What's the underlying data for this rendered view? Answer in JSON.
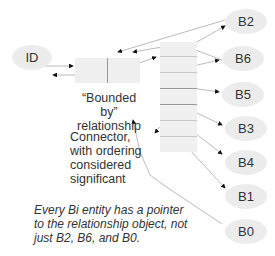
{
  "diagram": {
    "id_node": {
      "label": "ID"
    },
    "relationship_label": [
      "“Bounded by”",
      "relationship"
    ],
    "connector_label": [
      "Connector,",
      "with ordering",
      "considered",
      "significant"
    ],
    "note": [
      "Every Bi entity has a pointer",
      "to the relationship object, not",
      "just B2, B6, and B0."
    ],
    "b_nodes": [
      {
        "label": "B2"
      },
      {
        "label": "B6"
      },
      {
        "label": "B5"
      },
      {
        "label": "B3"
      },
      {
        "label": "B4"
      },
      {
        "label": "B1"
      },
      {
        "label": "B0"
      }
    ]
  },
  "colors": {
    "node_fill": "#ececec",
    "line": "#aaaaaa",
    "arrow": "#111111"
  }
}
